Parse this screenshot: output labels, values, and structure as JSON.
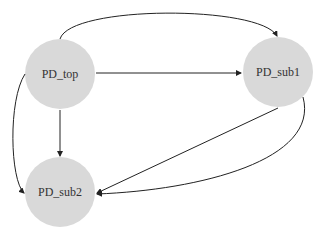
{
  "diagram": {
    "type": "directed-graph",
    "node_fill": "#d9d9d9",
    "edge_color": "#222222",
    "nodes": [
      {
        "id": "PD_top",
        "label": "PD_top",
        "cx": 60,
        "cy": 74,
        "r": 35
      },
      {
        "id": "PD_sub1",
        "label": "PD_sub1",
        "cx": 278,
        "cy": 72,
        "r": 35
      },
      {
        "id": "PD_sub2",
        "label": "PD_sub2",
        "cx": 60,
        "cy": 192,
        "r": 35
      }
    ],
    "edges": [
      {
        "from": "PD_top",
        "to": "PD_sub1",
        "style": "curved-top"
      },
      {
        "from": "PD_top",
        "to": "PD_sub1",
        "style": "straight"
      },
      {
        "from": "PD_top",
        "to": "PD_sub2",
        "style": "straight"
      },
      {
        "from": "PD_top",
        "to": "PD_sub2",
        "style": "curved-left"
      },
      {
        "from": "PD_sub1",
        "to": "PD_sub2",
        "style": "straight"
      },
      {
        "from": "PD_sub1",
        "to": "PD_sub2",
        "style": "curved-right"
      }
    ]
  }
}
